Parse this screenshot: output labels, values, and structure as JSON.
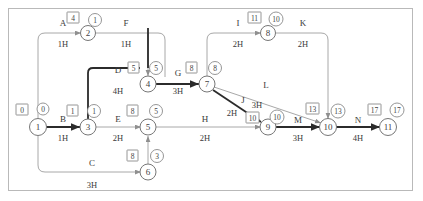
{
  "diagram": {
    "type": "network-diagram",
    "duration_unit": "H",
    "colors": {
      "critical_path": "#2b2b2b",
      "normal_edge": "#a8a8a8",
      "node_stroke": "#777777",
      "frame": "#b9b9b9",
      "background": "#ffffff"
    },
    "nodes": [
      {
        "id": "1",
        "label": "1",
        "x": 38,
        "y": 127,
        "early": "0",
        "late": "0",
        "tag_side": "above-left"
      },
      {
        "id": "2",
        "label": "2",
        "x": 88,
        "y": 33,
        "early": "4",
        "late": "1",
        "tag_side": "above-left"
      },
      {
        "id": "3",
        "label": "3",
        "x": 88,
        "y": 127,
        "early": "1",
        "late": "1",
        "tag_side": "above-left"
      },
      {
        "id": "4",
        "label": "4",
        "x": 148,
        "y": 84,
        "early": "5",
        "late": "5",
        "tag_side": "above-left"
      },
      {
        "id": "5",
        "label": "5",
        "x": 148,
        "y": 127,
        "early": "8",
        "late": "5",
        "tag_side": "above-left"
      },
      {
        "id": "6",
        "label": "6",
        "x": 148,
        "y": 172,
        "early": "8",
        "late": "3",
        "tag_side": "above-left"
      },
      {
        "id": "7",
        "label": "7",
        "x": 207,
        "y": 84,
        "early": "8",
        "late": "8",
        "tag_side": "above-left"
      },
      {
        "id": "8",
        "label": "8",
        "x": 268,
        "y": 33,
        "early": "11",
        "late": "10",
        "tag_side": "above-left"
      },
      {
        "id": "9",
        "label": "9",
        "x": 268,
        "y": 127,
        "early": "10",
        "late": "10",
        "tag_side": "above-left"
      },
      {
        "id": "10",
        "label": "10",
        "x": 328,
        "y": 127,
        "early": "13",
        "late": "13",
        "tag_side": "above-left"
      },
      {
        "id": "11",
        "label": "11",
        "x": 388,
        "y": 127,
        "early": "17",
        "late": "17",
        "tag_side": "above-left"
      }
    ],
    "activities": [
      {
        "id": "A",
        "name": "A",
        "duration": "1H",
        "from": "1",
        "to": "2",
        "critical": false,
        "label_x": 63,
        "label_y": 26,
        "dur_x": 63,
        "dur_y": 47
      },
      {
        "id": "B",
        "name": "B",
        "duration": "1H",
        "from": "1",
        "to": "3",
        "critical": true,
        "label_x": 63,
        "label_y": 122,
        "dur_x": 63,
        "dur_y": 141
      },
      {
        "id": "C",
        "name": "C",
        "duration": "3H",
        "from": "1",
        "to": "6",
        "critical": false,
        "label_x": 92,
        "label_y": 166,
        "dur_x": 92,
        "dur_y": 188
      },
      {
        "id": "D",
        "name": "D",
        "duration": "4H",
        "from": "3",
        "to": "4",
        "critical": true,
        "label_x": 118,
        "label_y": 73,
        "dur_x": 118,
        "dur_y": 94
      },
      {
        "id": "E",
        "name": "E",
        "duration": "2H",
        "from": "3",
        "to": "5",
        "critical": false,
        "label_x": 118,
        "label_y": 122,
        "dur_x": 118,
        "dur_y": 141
      },
      {
        "id": "F",
        "name": "F",
        "duration": "1H",
        "from": "2",
        "to": "4",
        "critical": false,
        "label_x": 126,
        "label_y": 26,
        "dur_x": 126,
        "dur_y": 47
      },
      {
        "id": "G",
        "name": "G",
        "duration": "3H",
        "from": "4",
        "to": "7",
        "critical": true,
        "label_x": 178,
        "label_y": 76,
        "dur_x": 178,
        "dur_y": 94
      },
      {
        "id": "H",
        "name": "H",
        "duration": "2H",
        "from": "5",
        "to": "9",
        "critical": false,
        "label_x": 205,
        "label_y": 122,
        "dur_x": 205,
        "dur_y": 141
      },
      {
        "id": "I",
        "name": "I",
        "duration": "2H",
        "from": "7",
        "to": "8",
        "critical": false,
        "label_x": 238,
        "label_y": 26,
        "dur_x": 238,
        "dur_y": 47
      },
      {
        "id": "J",
        "name": "J",
        "duration": "2H",
        "from": "7",
        "to": "9",
        "critical": true,
        "label_x": 243,
        "label_y": 103,
        "dur_x": 232,
        "dur_y": 116
      },
      {
        "id": "K",
        "name": "K",
        "duration": "2H",
        "from": "8",
        "to": "10",
        "critical": false,
        "label_x": 303,
        "label_y": 26,
        "dur_x": 303,
        "dur_y": 47
      },
      {
        "id": "L",
        "name": "L",
        "duration": "3H",
        "from": "7",
        "to": "10",
        "critical": false,
        "label_x": 266,
        "label_y": 88,
        "dur_x": 257,
        "dur_y": 108
      },
      {
        "id": "M",
        "name": "M",
        "duration": "3H",
        "from": "9",
        "to": "10",
        "critical": true,
        "label_x": 298,
        "label_y": 123,
        "dur_x": 298,
        "dur_y": 141
      },
      {
        "id": "N",
        "name": "N",
        "duration": "4H",
        "from": "10",
        "to": "11",
        "critical": true,
        "label_x": 358,
        "label_y": 123,
        "dur_x": 358,
        "dur_y": 141
      }
    ],
    "dummy_links": [
      {
        "from": "6",
        "to": "5",
        "style": "vertical-light"
      },
      {
        "from": "2",
        "to": "4",
        "style": "vertical-light-drop"
      }
    ]
  }
}
